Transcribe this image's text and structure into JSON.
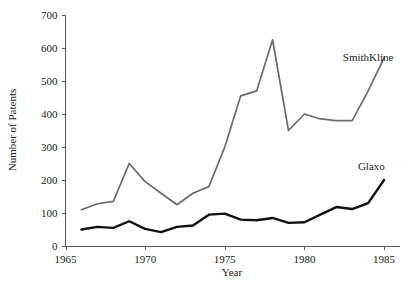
{
  "chart_data": {
    "type": "line",
    "title": "",
    "subtitle": "",
    "xlabel": "Year",
    "ylabel": "Number of Patents",
    "xlim": [
      1965,
      1986
    ],
    "ylim": [
      0,
      700
    ],
    "xticks": [
      1965,
      1970,
      1975,
      1980,
      1985
    ],
    "xtick_labels": [
      "1965",
      "1970",
      "1975",
      "1980",
      "1985"
    ],
    "yticks": [
      0,
      100,
      200,
      300,
      400,
      500,
      600,
      700
    ],
    "ytick_labels": [
      "0",
      "100",
      "200",
      "300",
      "400",
      "500",
      "600",
      "700"
    ],
    "grid": false,
    "legend_position": "inline-right-labels",
    "x": [
      1966,
      1967,
      1968,
      1969,
      1970,
      1971,
      1972,
      1973,
      1974,
      1975,
      1976,
      1977,
      1978,
      1979,
      1980,
      1981,
      1982,
      1983,
      1984,
      1985
    ],
    "series": [
      {
        "name": "SmithKline",
        "color": "#6b6b6b",
        "values": [
          110,
          128,
          135,
          250,
          195,
          160,
          125,
          160,
          180,
          300,
          455,
          470,
          625,
          350,
          400,
          385,
          380,
          380,
          470,
          570
        ]
      },
      {
        "name": "Glaxo",
        "color": "#111111",
        "values": [
          50,
          58,
          55,
          75,
          52,
          42,
          58,
          62,
          95,
          98,
          80,
          78,
          85,
          70,
          72,
          95,
          118,
          112,
          130,
          200
        ]
      }
    ],
    "annotations": [
      {
        "text": "SmithKline",
        "x": 1984.0,
        "y": 560
      },
      {
        "text": "Glaxo",
        "x": 1984.2,
        "y": 230
      }
    ]
  }
}
